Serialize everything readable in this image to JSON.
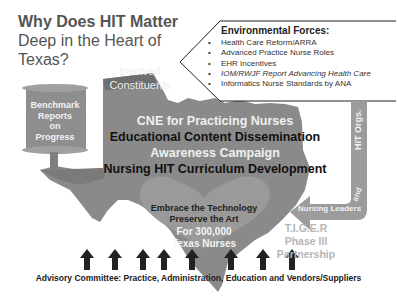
{
  "title": {
    "bold": "Why Does HIT Matter",
    "line2": "Deep in the Heart of",
    "line3": "Texas?"
  },
  "environmental_forces": {
    "heading": "Environmental Forces:",
    "items": [
      {
        "bullet": "•",
        "text": "Health Care Reform/ARRA",
        "italic": false
      },
      {
        "bullet": "•",
        "text": "Advanced Practice Nurse Roles",
        "italic": false
      },
      {
        "bullet": "•",
        "text": "EHR Incentives",
        "italic": false
      },
      {
        "bullet": "•",
        "text": "IOM/RWJF Report Advancing Health Care",
        "italic": true
      },
      {
        "bullet": "•",
        "text": "Informatics Nurse Standards by ANA",
        "italic": false
      }
    ]
  },
  "benchmark_scroll": {
    "lines": [
      "Benchmark",
      "Reports",
      "on",
      "Progress"
    ]
  },
  "involved_constituents": {
    "lines": [
      "Involved",
      "Constituents"
    ]
  },
  "texas_center": {
    "lines": [
      {
        "text": "CNE for Practicing Nurses",
        "color": "#f0f0f0"
      },
      {
        "text": "Educational Content Dissemination",
        "color": "#111111"
      },
      {
        "text": "Awareness Campaign",
        "color": "#f0f0f0"
      },
      {
        "text": "Nursing HIT Curriculum Development",
        "color": "#111111"
      }
    ]
  },
  "heart": {
    "line1": "Embrace the Technology",
    "line2": "Preserve the Art",
    "line3": "For 300,000",
    "line4": "Texas Nurses",
    "dark_color": "#222222",
    "light_color": "#f4f4f4"
  },
  "right_arrow": {
    "top_label": "HIT Orgs.",
    "and_label": "and",
    "bottom_label": "Nursing Leaders"
  },
  "tiger": {
    "lines": [
      "T.I.G.E.R",
      "Phase III",
      "Partnership"
    ]
  },
  "advisory": {
    "text": "Advisory Committee: Practice, Administration, Education and Vendors/Suppliers",
    "arrow_count": 8
  },
  "colors": {
    "title_gray": "#555555",
    "texas_fill": "#8a8a8a",
    "texas_dark": "#6f6f6f",
    "scroll_fill": "#8e8e8e",
    "heart_fill": "#9a9a9a",
    "arrow_fill": "#9c9c9c",
    "tiger_text": "#b5b5b5",
    "up_arrow": "#222222"
  }
}
